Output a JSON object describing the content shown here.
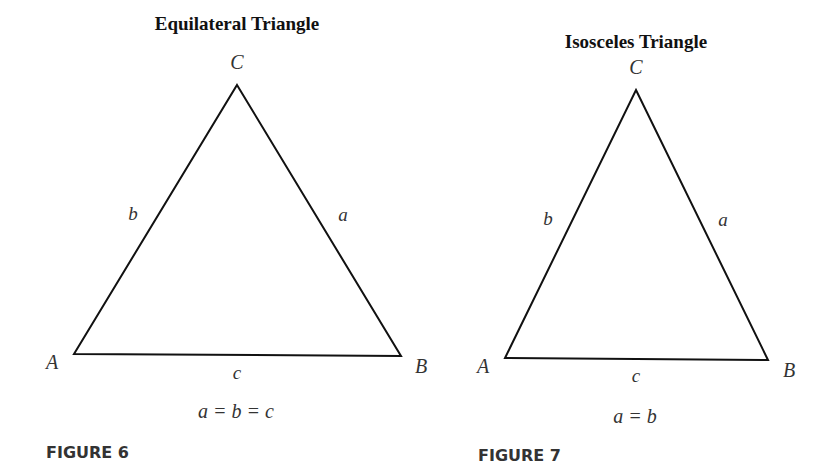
{
  "figures": [
    {
      "title": "Equilateral Triangle",
      "figure_label": "FIGURE 6",
      "equation": "a = b = c",
      "vertices": {
        "A": {
          "label": "A",
          "x": 74,
          "y": 354
        },
        "B": {
          "label": "B",
          "x": 401,
          "y": 356
        },
        "C": {
          "label": "C",
          "x": 237,
          "y": 85
        }
      },
      "sides": {
        "a": "a",
        "b": "b",
        "c": "c"
      }
    },
    {
      "title": "Isosceles Triangle",
      "figure_label": "FIGURE 7",
      "equation": "a = b",
      "vertices": {
        "A": {
          "label": "A",
          "x": 505,
          "y": 358
        },
        "B": {
          "label": "B",
          "x": 768,
          "y": 360
        },
        "C": {
          "label": "C",
          "x": 636,
          "y": 90
        }
      },
      "sides": {
        "a": "a",
        "b": "b",
        "c": "c"
      }
    }
  ],
  "colors": {
    "line": "#111111",
    "text": "#333333",
    "background": "#ffffff"
  }
}
